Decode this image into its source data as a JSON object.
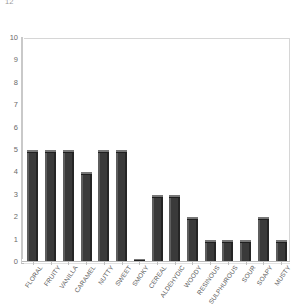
{
  "chart_data": {
    "type": "bar",
    "title": "",
    "subtitle": "",
    "xlabel": "",
    "ylabel": "",
    "ylim": [
      0,
      10
    ],
    "ytick_labels": [
      "10",
      "9",
      "8",
      "7",
      "6",
      "5",
      "4",
      "3",
      "2",
      "1",
      "0"
    ],
    "ytick_values": [
      10,
      9,
      8,
      7,
      6,
      5,
      4,
      3,
      2,
      1,
      0
    ],
    "grid": false,
    "legend": null,
    "legend_position": "none",
    "bar_color": "#3a3a3a",
    "plot_background": "#ffffff",
    "axis_color": "#c9c9c9",
    "categories": [
      "FLORAL",
      "FRUITY",
      "VANILLA",
      "CARAMEL",
      "NUTTY",
      "SWEET",
      "SMOKY",
      "CEREAL",
      "ALDEHYDIC",
      "WOODY",
      "RESINOUS",
      "SULPHUROUS",
      "SOUR",
      "SOAPY",
      "MUSTY"
    ],
    "values": [
      5,
      5,
      5,
      4,
      5,
      5,
      0.15,
      3,
      3,
      2,
      1,
      1,
      1,
      2,
      1
    ]
  },
  "axis": {
    "top_clipped_label": "12"
  }
}
